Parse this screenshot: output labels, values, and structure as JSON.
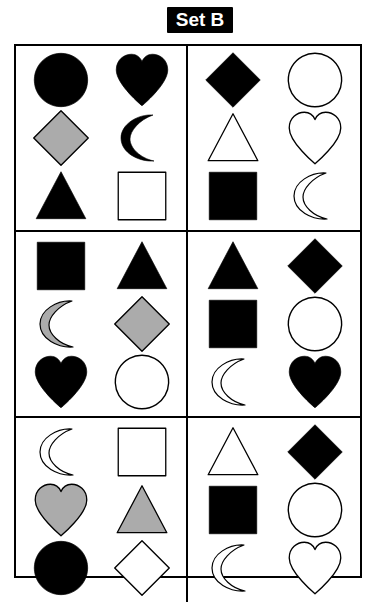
{
  "title": {
    "label": "Set B"
  },
  "colors": {
    "black": "#000000",
    "white": "#ffffff",
    "gray": "#ababab",
    "outline": "#000000",
    "background": "#ffffff"
  },
  "grid": {
    "rows": 3,
    "columns": 2,
    "cell_rows": 3,
    "cell_columns": 2,
    "cells": [
      {
        "position": "top-left",
        "index": 1,
        "shapes": [
          {
            "shape": "circle",
            "fill": "black",
            "slot": "r1c1"
          },
          {
            "shape": "heart",
            "fill": "black",
            "slot": "r1c2"
          },
          {
            "shape": "diamond",
            "fill": "gray",
            "slot": "r2c1"
          },
          {
            "shape": "crescent",
            "fill": "black",
            "slot": "r2c2"
          },
          {
            "shape": "triangle",
            "fill": "black",
            "slot": "r3c1"
          },
          {
            "shape": "square",
            "fill": "white",
            "slot": "r3c2"
          }
        ]
      },
      {
        "position": "top-right",
        "index": 2,
        "shapes": [
          {
            "shape": "diamond",
            "fill": "black",
            "slot": "r1c1"
          },
          {
            "shape": "circle",
            "fill": "white",
            "slot": "r1c2"
          },
          {
            "shape": "triangle",
            "fill": "white",
            "slot": "r2c1"
          },
          {
            "shape": "heart",
            "fill": "white",
            "slot": "r2c2"
          },
          {
            "shape": "square",
            "fill": "black",
            "slot": "r3c1"
          },
          {
            "shape": "crescent",
            "fill": "white",
            "slot": "r3c2"
          }
        ]
      },
      {
        "position": "middle-left",
        "index": 3,
        "shapes": [
          {
            "shape": "square",
            "fill": "black",
            "slot": "r1c1"
          },
          {
            "shape": "triangle",
            "fill": "black",
            "slot": "r1c2"
          },
          {
            "shape": "crescent",
            "fill": "gray",
            "slot": "r2c1"
          },
          {
            "shape": "diamond",
            "fill": "gray",
            "slot": "r2c2"
          },
          {
            "shape": "heart",
            "fill": "black",
            "slot": "r3c1"
          },
          {
            "shape": "circle",
            "fill": "white",
            "slot": "r3c2"
          }
        ]
      },
      {
        "position": "middle-right",
        "index": 4,
        "shapes": [
          {
            "shape": "triangle",
            "fill": "black",
            "slot": "r1c1"
          },
          {
            "shape": "diamond",
            "fill": "black",
            "slot": "r1c2"
          },
          {
            "shape": "square",
            "fill": "black",
            "slot": "r2c1"
          },
          {
            "shape": "circle",
            "fill": "white",
            "slot": "r2c2"
          },
          {
            "shape": "crescent",
            "fill": "white",
            "slot": "r3c1"
          },
          {
            "shape": "heart",
            "fill": "black",
            "slot": "r3c2"
          }
        ]
      },
      {
        "position": "bottom-left",
        "index": 5,
        "shapes": [
          {
            "shape": "crescent",
            "fill": "white",
            "slot": "r1c1"
          },
          {
            "shape": "square",
            "fill": "white",
            "slot": "r1c2"
          },
          {
            "shape": "heart",
            "fill": "gray",
            "slot": "r2c1"
          },
          {
            "shape": "triangle",
            "fill": "gray",
            "slot": "r2c2"
          },
          {
            "shape": "circle",
            "fill": "black",
            "slot": "r3c1"
          },
          {
            "shape": "diamond",
            "fill": "white",
            "slot": "r3c2"
          }
        ]
      },
      {
        "position": "bottom-right",
        "index": 6,
        "shapes": [
          {
            "shape": "triangle",
            "fill": "white",
            "slot": "r1c1"
          },
          {
            "shape": "diamond",
            "fill": "black",
            "slot": "r1c2"
          },
          {
            "shape": "square",
            "fill": "black",
            "slot": "r2c1"
          },
          {
            "shape": "circle",
            "fill": "white",
            "slot": "r2c2"
          },
          {
            "shape": "crescent",
            "fill": "white",
            "slot": "r3c1"
          },
          {
            "shape": "heart",
            "fill": "white",
            "slot": "r3c2"
          }
        ]
      }
    ]
  }
}
